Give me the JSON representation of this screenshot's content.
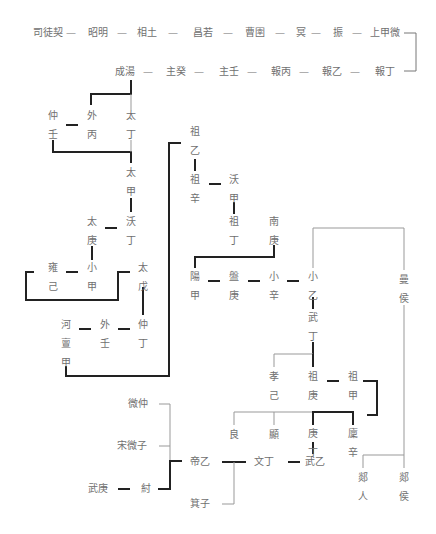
{
  "diagram": {
    "type": "genealogy",
    "rows": {
      "ancestors": [
        "司徒契",
        "昭明",
        "相土",
        "昌若",
        "曹圉",
        "冥",
        "振",
        "上甲微"
      ],
      "early_kings": [
        "成湯",
        "主癸",
        "主壬",
        "報丙",
        "報乙",
        "報丁"
      ]
    },
    "nodes": {
      "zhongren": "仲壬",
      "waibing": "外丙",
      "taiding": "太丁",
      "taijia": "太甲",
      "taigeng": "太庚",
      "woding": "沃丁",
      "yongji": "雍己",
      "xiaojia": "小甲",
      "taiwu": "太戊",
      "hedanjia": "河亶甲",
      "wairen": "外壬",
      "zhongding": "仲丁",
      "zuyi": "祖乙",
      "zuxin": "祖辛",
      "wojia": "沃甲",
      "zuding": "祖丁",
      "nangeng": "南庚",
      "yangjia": "陽甲",
      "pangeng": "盤庚",
      "xiaoxin": "小辛",
      "xiaoyi": "小乙",
      "wuding": "武丁",
      "manhou": "曼侯",
      "xiaoji": "孝己",
      "zugeng": "祖庚",
      "zujia": "祖甲",
      "liang": "良",
      "xian": "顯",
      "gengding": "庚丁",
      "linxin": "廩辛",
      "wuyi": "武乙",
      "wending": "文丁",
      "diyi": "帝乙",
      "jizi": "箕子",
      "weizhong": "微仲",
      "songweizi": "宋微子",
      "wugeng": "武庚",
      "zhou": "紂",
      "tanren": "郯人",
      "tanhou": "郯侯"
    },
    "separator": "—"
  }
}
